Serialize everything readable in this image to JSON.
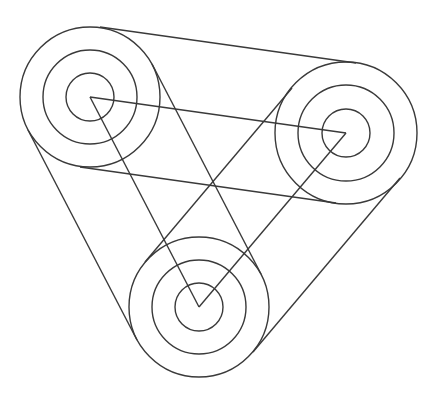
{
  "diagram": {
    "title": "",
    "stroke_color": "#3a3a3a",
    "background": "#ffffff",
    "pulleys": [
      {
        "name": "pulley-top-left",
        "cx": 90,
        "cy": 97,
        "radii": [
          70,
          47,
          24
        ]
      },
      {
        "name": "pulley-right",
        "cx": 346,
        "cy": 133,
        "radii": [
          71,
          48,
          24
        ]
      },
      {
        "name": "pulley-bottom",
        "cx": 199,
        "cy": 307,
        "radii": [
          70,
          47,
          24
        ]
      }
    ],
    "lines": [
      {
        "name": "belt-top-left-to-right-outer",
        "x1": 100,
        "y1": 27,
        "x2": 356,
        "y2": 63
      },
      {
        "name": "center-top-left-to-right",
        "x1": 90,
        "y1": 97,
        "x2": 346,
        "y2": 133
      },
      {
        "name": "belt-top-left-to-right-lower",
        "x1": 80,
        "y1": 167,
        "x2": 336,
        "y2": 203
      },
      {
        "name": "belt-top-left-to-bottom-outer",
        "x1": 28,
        "y1": 130,
        "x2": 137,
        "y2": 340
      },
      {
        "name": "center-top-left-to-bottom",
        "x1": 90,
        "y1": 97,
        "x2": 199,
        "y2": 307
      },
      {
        "name": "belt-top-left-to-bottom-inner",
        "x1": 152,
        "y1": 64,
        "x2": 261,
        "y2": 274
      },
      {
        "name": "center-bottom-to-right",
        "x1": 199,
        "y1": 307,
        "x2": 346,
        "y2": 133
      },
      {
        "name": "belt-bottom-to-right-upper",
        "x1": 145,
        "y1": 262,
        "x2": 292,
        "y2": 88
      },
      {
        "name": "belt-bottom-to-right-outer",
        "x1": 253,
        "y1": 352,
        "x2": 400,
        "y2": 178
      }
    ]
  }
}
